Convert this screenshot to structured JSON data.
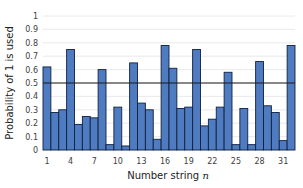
{
  "chart_data": {
    "type": "bar",
    "title": "",
    "xlabel": "Number string n",
    "xlabel_text": "Number string ",
    "xlabel_var": "n",
    "ylabel": "Probability of 1 is used",
    "ylim": [
      0,
      1
    ],
    "yticks": [
      "0",
      "0.1",
      "0.2",
      "0.3",
      "0.4",
      "0.5",
      "0.6",
      "0.7",
      "0.8",
      "0.9",
      "1"
    ],
    "xtick_labels": [
      "1",
      "4",
      "7",
      "10",
      "13",
      "16",
      "19",
      "22",
      "25",
      "28",
      "31"
    ],
    "categories": [
      1,
      2,
      3,
      4,
      5,
      6,
      7,
      8,
      9,
      10,
      11,
      12,
      13,
      14,
      15,
      16,
      17,
      18,
      19,
      20,
      21,
      22,
      23,
      24,
      25,
      26,
      27,
      28,
      29,
      30,
      31,
      32
    ],
    "values": [
      0.62,
      0.28,
      0.3,
      0.75,
      0.19,
      0.25,
      0.24,
      0.6,
      0.04,
      0.32,
      0.03,
      0.65,
      0.35,
      0.3,
      0.08,
      0.78,
      0.61,
      0.31,
      0.32,
      0.75,
      0.18,
      0.23,
      0.32,
      0.58,
      0.04,
      0.31,
      0.04,
      0.66,
      0.33,
      0.28,
      0.07,
      0.78
    ],
    "reference_line": {
      "y": 0.5,
      "color": "#000000"
    },
    "grid": true,
    "legend": "none",
    "colors": {
      "bar_fill": "#4f7bc0",
      "bar_edge": "#10213f",
      "grid": "#e4e4e4",
      "reference": "#1a1a1a"
    }
  }
}
